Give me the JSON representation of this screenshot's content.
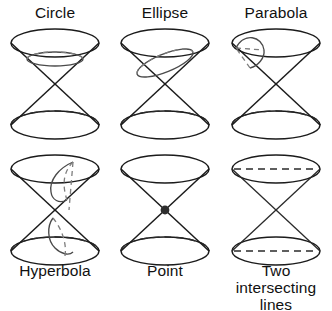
{
  "figure": {
    "background_color": "#ffffff",
    "stroke_color": "#1b1b1b",
    "cut_curve_color": "#4a4a4a",
    "hidden_edge_style": "dashed",
    "columns": 3,
    "rows": 2
  },
  "panels": [
    {
      "id": "circle",
      "label": "Circle",
      "row": 1,
      "column": 1,
      "plane": "horizontal",
      "cut_shape": "ellipse-horizontal",
      "description": "Plane perpendicular to the cone axis cuts the upper nappe in a circle"
    },
    {
      "id": "ellipse",
      "label": "Ellipse",
      "row": 1,
      "column": 2,
      "plane": "oblique",
      "cut_shape": "ellipse-tilted",
      "description": "Plane tilted less than the slant angle cuts one nappe in an ellipse"
    },
    {
      "id": "parabola",
      "label": "Parabola",
      "row": 1,
      "column": 3,
      "plane": "parallel-to-slant",
      "cut_shape": "parabola-open",
      "description": "Plane parallel to a slant line cuts one nappe in a parabola"
    },
    {
      "id": "hyperbola",
      "label": "Hyperbola",
      "row": 2,
      "column": 1,
      "plane": "vertical",
      "cut_shape": "two-branches",
      "description": "Plane cutting both nappes gives a hyperbola with two branches"
    },
    {
      "id": "point",
      "label": "Point",
      "row": 2,
      "column": 2,
      "plane": "through-apex",
      "cut_shape": "point",
      "description": "Degenerate case: plane through apex only gives a single point"
    },
    {
      "id": "two-intersecting-lines",
      "label": "Two intersecting\nlines",
      "row": 2,
      "column": 3,
      "plane": "through-apex-vertical",
      "cut_shape": "two-lines",
      "description": "Degenerate case: vertical plane through the apex gives two intersecting lines"
    }
  ]
}
